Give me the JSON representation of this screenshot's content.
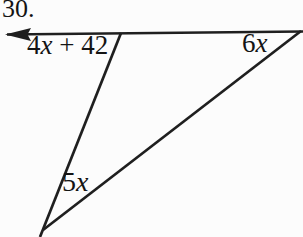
{
  "figure": {
    "problem_number": "30.",
    "background_color": "#fcfcfc",
    "line_color": "#1f1f1f",
    "text_color": "#141414",
    "angles": {
      "exterior_top_left": {
        "coefficient": "4",
        "variable": "x",
        "suffix": " + 42"
      },
      "top_right": {
        "coefficient": "6",
        "variable": "x",
        "suffix": ""
      },
      "bottom": {
        "coefficient": "5",
        "variable": "x",
        "suffix": ""
      }
    }
  }
}
